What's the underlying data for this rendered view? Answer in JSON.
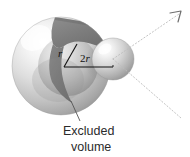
{
  "figure": {
    "background_color": "#ffffff",
    "width": 190,
    "height": 157
  },
  "labels": {
    "radius_label": "r",
    "diameter_label": "2r",
    "diameter_coefficient": "2",
    "diameter_symbol": "r",
    "caption_line_1": "Excluded",
    "caption_line_2": "volume"
  },
  "colors": {
    "sphere_light": "#fcfcfc",
    "sphere_mid": "#c9c9c9",
    "sphere_dark": "#9a9a9a",
    "sphere_edge": "#8e8e8e",
    "cut_face_light": "#9d9d9d",
    "cut_face_dark": "#6f6f6f",
    "inner_sphere_light": "#e2e2e2",
    "inner_sphere_dark": "#8a8a8a",
    "small_sphere_light": "#fafafa",
    "small_sphere_dark": "#8f8f8f",
    "line_color": "#111111",
    "dotted_line_color": "#b9b9b9",
    "caption_color": "#2b2b2b"
  },
  "geometry": {
    "large_sphere": {
      "cx": 61,
      "cy": 66,
      "r": 49
    },
    "inner_sphere": {
      "cx": 68,
      "cy": 66,
      "r": 30
    },
    "small_sphere": {
      "cx": 113,
      "cy": 59,
      "r": 21
    },
    "radius_line": {
      "x1": 64,
      "y1": 67,
      "x2": 76,
      "y2": 45
    },
    "diameter_line": {
      "x1": 64,
      "y1": 67,
      "x2": 113,
      "y2": 67
    },
    "caption_leader": {
      "x1": 72,
      "y1": 103,
      "x2": 80,
      "y2": 120
    }
  },
  "annotations": {
    "dotted_ray_upper": {
      "x1": 113,
      "y1": 59,
      "x2": 180,
      "y2": 13
    },
    "dotted_ray_lower": {
      "x1": 113,
      "y1": 59,
      "x2": 182,
      "y2": 119
    },
    "arrowhead_present": true,
    "arrowhead_direction": "up-right"
  },
  "icons": {
    "arrowhead": "arrowhead-icon",
    "leader_line": "leader-line-icon",
    "dotted_ray": "dotted-ray-icon"
  }
}
